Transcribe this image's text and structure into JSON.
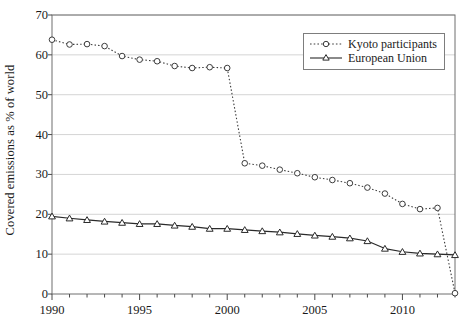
{
  "chart_data": {
    "type": "line",
    "title": "",
    "xlabel": "",
    "ylabel": "Covered emissions as % of world",
    "xlim": [
      1990,
      2013
    ],
    "ylim": [
      0,
      70
    ],
    "ytick_labels": [
      "0",
      "10",
      "20",
      "30",
      "40",
      "50",
      "60",
      "70"
    ],
    "ytick_values": [
      0,
      10,
      20,
      30,
      40,
      50,
      60,
      70
    ],
    "xtick_labels": [
      "1990",
      "1995",
      "2000",
      "2005",
      "2010"
    ],
    "xtick_values": [
      1990,
      1995,
      2000,
      2005,
      2010
    ],
    "x_minor_ticks_every": 1,
    "grid": "horizontal",
    "legend_position": "top-right",
    "x": [
      1990,
      1991,
      1992,
      1993,
      1994,
      1995,
      1996,
      1997,
      1998,
      1999,
      2000,
      2001,
      2002,
      2003,
      2004,
      2005,
      2006,
      2007,
      2008,
      2009,
      2010,
      2011,
      2012,
      2013
    ],
    "series": [
      {
        "name": "Kyoto participants",
        "marker": "circle-open",
        "linestyle": "dotted",
        "color": "#3c3c3c",
        "values": [
          63.8,
          62.6,
          62.7,
          62.2,
          59.7,
          58.8,
          58.4,
          57.2,
          56.7,
          56.9,
          56.7,
          32.8,
          32.2,
          31.2,
          30.3,
          29.3,
          28.6,
          27.8,
          26.7,
          25.2,
          22.6,
          21.3,
          21.6,
          0.2
        ]
      },
      {
        "name": "European Union",
        "marker": "triangle-open",
        "linestyle": "solid",
        "color": "#2a2a2a",
        "values": [
          19.5,
          19.0,
          18.6,
          18.2,
          17.9,
          17.6,
          17.6,
          17.2,
          16.9,
          16.4,
          16.4,
          16.1,
          15.8,
          15.5,
          15.1,
          14.7,
          14.4,
          14.0,
          13.3,
          11.4,
          10.6,
          10.2,
          10.0,
          9.8
        ]
      }
    ]
  },
  "legend": {
    "entries": [
      {
        "label": "Kyoto participants"
      },
      {
        "label": "European Union"
      }
    ]
  }
}
